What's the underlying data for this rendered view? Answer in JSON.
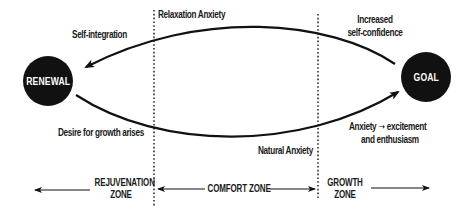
{
  "diagram": {
    "nodes": {
      "left": {
        "label": "RENEWAL"
      },
      "right": {
        "label": "GOAL"
      }
    },
    "top_arc": {
      "label_start": "Increased",
      "label_start_2": "self-confidence",
      "label_mid": "Relaxation Anxiety",
      "label_end": "Self-integration"
    },
    "bottom_arc": {
      "label_start": "Desire  for growth arises",
      "label_mid": "Natural Anxiety",
      "label_end_1": "Anxiety",
      "label_end_arrow": "➝",
      "label_end_2": "excitement",
      "label_end_3": "and enthusiasm"
    },
    "zones": {
      "rejuvenation": {
        "line1": "REJUVENATION",
        "line2": "ZONE"
      },
      "comfort": {
        "label": "COMFORT ZONE"
      },
      "growth": {
        "line1": "GROWTH",
        "line2": "ZONE"
      }
    },
    "colors": {
      "ink": "#111111",
      "background": "#ffffff",
      "node_text": "#ffffff"
    }
  }
}
